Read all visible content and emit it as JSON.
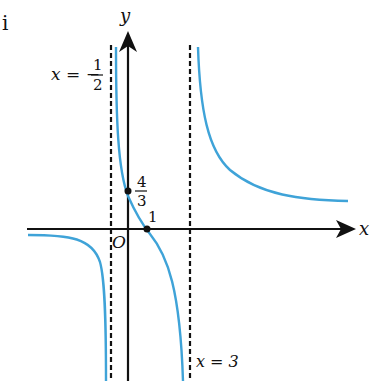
{
  "figure": {
    "corner_label": "i",
    "axes": {
      "x_label": "x",
      "y_label": "y",
      "origin_label": "O"
    },
    "asymptotes": [
      {
        "name": "left",
        "eq_prefix": "x = −",
        "numerator": "1",
        "denominator": "2"
      },
      {
        "name": "right",
        "label": "x = 3"
      }
    ],
    "points": [
      {
        "name": "y-intercept",
        "numerator": "4",
        "denominator": "3"
      },
      {
        "name": "x-intercept",
        "label": "1"
      }
    ],
    "colors": {
      "curve": "#3fa3d8",
      "axis": "#111111",
      "asymptote": "#111111"
    }
  }
}
